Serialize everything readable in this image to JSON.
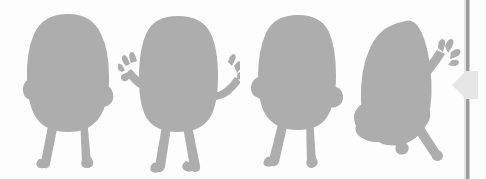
{
  "canvas": {
    "background_color": "#fdfdfd",
    "label": "character-frames-canvas",
    "figure_fill": "#adadad",
    "frame_count": "4"
  },
  "figures": [
    {
      "name": "figure-standing-arms-down",
      "pose_label": "standing, arms at sides",
      "fill": "#adadad"
    },
    {
      "name": "figure-arms-raised",
      "pose_label": "standing, both arms raised with open hands",
      "fill": "#adadad"
    },
    {
      "name": "figure-standing-turned",
      "pose_label": "standing, turned, arms at sides",
      "fill": "#adadad"
    },
    {
      "name": "figure-tilted-one-arm-up",
      "pose_label": "tilted falling, one arm raised, leg extended",
      "fill": "#adadad"
    }
  ],
  "panel": {
    "divider_name": "panel-divider",
    "divider_color": "#9b9b9b",
    "highlight_color": "#e3e3e3",
    "collapse_handle_name": "collapse-panel-chevron",
    "collapse_handle_color": "#e6e6e6",
    "collapse_direction": "left"
  }
}
